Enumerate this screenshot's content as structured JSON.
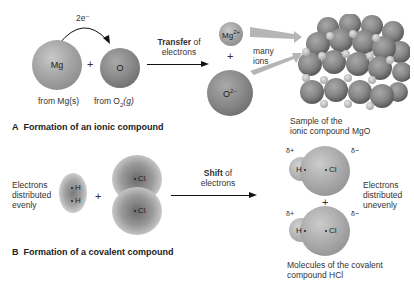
{
  "partA": {
    "electron_label": "2e⁻",
    "mg_atom": "Mg",
    "plus1": "+",
    "o_atom": "O",
    "from_mg": "from Mg(s)",
    "from_o2_prefix": "from O",
    "from_o2_sub": "2",
    "from_o2_suffix": "(g)",
    "transfer_bold": "Transfer",
    "transfer_rest": " of",
    "transfer_line2": "electrons",
    "mg_ion": "Mg",
    "mg_ion_charge": "2+",
    "plus2": "+",
    "o_ion": "O",
    "o_ion_charge": "2−",
    "many_ions_1": "many",
    "many_ions_2": "ions",
    "sample_1": "Sample of the",
    "sample_2": "ionic compound MgO",
    "caption_letter": "A",
    "caption": "Formation of an ionic compound"
  },
  "partB": {
    "even_1": "Electrons",
    "even_2": "distributed",
    "even_3": "evenly",
    "h_top": "H",
    "h_bottom": "H",
    "plus1": "+",
    "cl_top": "Cl",
    "cl_bottom": "Cl",
    "shift_bold": "Shift",
    "shift_rest": " of",
    "shift_line2": "electrons",
    "delta_plus": "δ+",
    "delta_minus": "δ−",
    "hcl_h": "H",
    "hcl_cl": "Cl",
    "plus2": "+",
    "uneven_1": "Electrons",
    "uneven_2": "distributed",
    "uneven_3": "unevenly",
    "molecules_1": "Molecules of the covalent",
    "molecules_2": "compound HCl",
    "caption_letter": "B",
    "caption": "Formation of a covalent compound"
  },
  "colors": {
    "mg_sphere": "#a8a8a8",
    "o_sphere": "#8a8a8a",
    "arrow": "#111111",
    "ion_arrow": "#b0b0b0"
  }
}
